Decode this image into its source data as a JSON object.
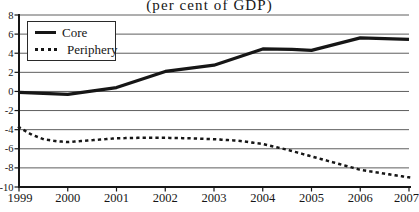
{
  "title": "(per cent of GDP)",
  "colors": {
    "ink": "#161616",
    "grid": "#5e5e5e",
    "background": "#ffffff"
  },
  "legend": {
    "position": "top-left",
    "items": [
      {
        "label": "Core",
        "style": "solid"
      },
      {
        "label": "Periphery",
        "style": "dotted"
      }
    ]
  },
  "chart_data": {
    "type": "line",
    "title": "(per cent of GDP)",
    "xlabel": "",
    "ylabel": "",
    "xlim": [
      1999,
      2007
    ],
    "ylim": [
      -10,
      8
    ],
    "x_ticks": [
      1999,
      2000,
      2001,
      2002,
      2003,
      2004,
      2005,
      2006,
      2007
    ],
    "y_ticks": [
      8,
      6,
      4,
      2,
      0,
      -2,
      -4,
      -6,
      -8,
      -10
    ],
    "grid": "horizontal-only",
    "legend_position": "top-left",
    "series": [
      {
        "name": "Core",
        "style": "solid",
        "x": [
          1999,
          2000,
          2001,
          2002,
          2003,
          2004,
          2004.6,
          2005,
          2006,
          2007
        ],
        "values": [
          -0.1,
          -0.3,
          0.4,
          2.1,
          2.75,
          4.45,
          4.4,
          4.3,
          5.6,
          5.45
        ]
      },
      {
        "name": "Periphery",
        "style": "dotted",
        "x": [
          1999,
          1999.25,
          1999.5,
          1999.75,
          2000,
          2000.5,
          2001,
          2001.5,
          2002,
          2002.5,
          2003,
          2003.5,
          2004,
          2004.5,
          2005,
          2005.5,
          2006,
          2006.5,
          2007
        ],
        "values": [
          -3.75,
          -4.5,
          -5.0,
          -5.2,
          -5.3,
          -5.1,
          -4.9,
          -4.85,
          -4.85,
          -4.9,
          -5.0,
          -5.15,
          -5.5,
          -6.1,
          -6.8,
          -7.5,
          -8.2,
          -8.6,
          -9.0
        ]
      }
    ]
  }
}
